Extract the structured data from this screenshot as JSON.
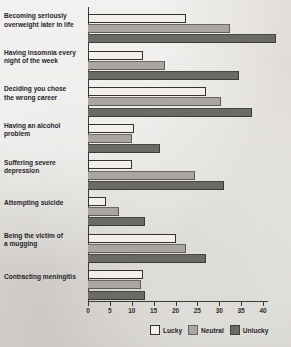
{
  "chart_data": {
    "type": "bar",
    "orientation": "horizontal",
    "title": "",
    "subtitle": "",
    "xlabel": "",
    "ylabel": "",
    "xlim": [
      0,
      40
    ],
    "xticks": [
      0,
      5,
      10,
      15,
      20,
      25,
      30,
      35,
      40
    ],
    "grid": false,
    "legend_position": "bottom-right",
    "categories": [
      "Becoming seriously overweight later in life",
      "Having insomnia every night of the week",
      "Deciding you chose the wrong career",
      "Having an alcohol problem",
      "Suffering severe depression",
      "Attempting suicide",
      "Being the victim of a mugging",
      "Contracting meningitis"
    ],
    "series": [
      {
        "name": "Lucky",
        "color": "#f4f1ed",
        "values": [
          22.5,
          12.5,
          27.0,
          10.5,
          10.0,
          4.0,
          20.0,
          12.5
        ]
      },
      {
        "name": "Neutral",
        "color": "#a9a6a1",
        "values": [
          32.5,
          17.5,
          30.5,
          10.0,
          24.5,
          7.0,
          22.5,
          12.0
        ]
      },
      {
        "name": "Unlucky",
        "color": "#6c6a66",
        "values": [
          43.0,
          34.5,
          37.5,
          16.5,
          31.0,
          13.0,
          27.0,
          13.0
        ]
      }
    ]
  },
  "axis": {
    "tick_labels": [
      "0",
      "5",
      "10",
      "15",
      "20",
      "25",
      "30",
      "35",
      "40"
    ]
  },
  "category_labels": [
    "Becoming seriously\noverweight later in life",
    "Having insomnia every\nnight of the week",
    "Deciding you chose\nthe wrong career",
    "Having an alcohol\nproblem",
    "Suffering severe\ndepression",
    "Attempting suicide",
    "Being the victim of\na mugging",
    "Contracting meningitis"
  ],
  "legend": {
    "items": [
      {
        "label": "Lucky",
        "swatch": "lucky"
      },
      {
        "label": "Neutral",
        "swatch": "neutral"
      },
      {
        "label": "Unlucky",
        "swatch": "unlucky"
      }
    ]
  },
  "colors": {
    "background": "#dedbd6",
    "axis": "#3a3a38",
    "text": "#26262a",
    "lucky": "#f4f1ed",
    "neutral": "#a9a6a1",
    "unlucky": "#6c6a66"
  }
}
